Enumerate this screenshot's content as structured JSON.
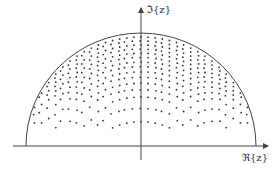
{
  "figure": {
    "type": "complex-plane semicircle point distribution",
    "x_axis_label": "ℜ{z}",
    "y_axis_label": "ℑ{z}",
    "colors": {
      "stroke": "#444444",
      "dots": "#333333",
      "background": "#ffffff"
    }
  },
  "geometry": {
    "origin": [
      141,
      146
    ],
    "x_axis": {
      "x1": 13,
      "x2": 268,
      "y": 146
    },
    "y_axis": {
      "x": 141,
      "y1": 160,
      "y2": 8
    },
    "arc": {
      "cx": 141,
      "cy": 146,
      "rx": 115,
      "ry": 113
    },
    "dots": {
      "column_spacing": 7.1,
      "top_row_spacing": 4.0,
      "bottom_y": 128
    }
  }
}
